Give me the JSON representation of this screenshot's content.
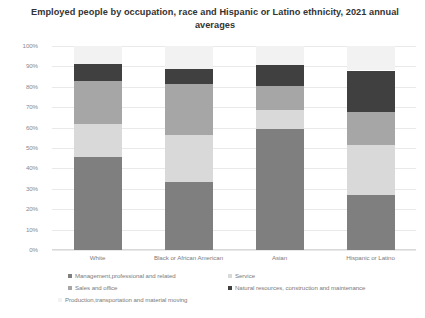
{
  "chart_data": {
    "type": "bar",
    "subtype": "stacked-percent",
    "title": "Employed people by occupation, race and Hispanic or Latino ethnicity, 2021 annual averages",
    "xlabel": "",
    "ylabel": "",
    "ylim": [
      0,
      100
    ],
    "grid": true,
    "legend_position": "bottom",
    "categories": [
      "White",
      "Black or African American",
      "Asian",
      "Hispanic or Latino"
    ],
    "ytick_labels": [
      "100%",
      "90%",
      "80%",
      "70%",
      "60%",
      "50%",
      "40%",
      "30%",
      "20%",
      "10%",
      "0%"
    ],
    "ytick_values": [
      100,
      90,
      80,
      70,
      60,
      50,
      40,
      30,
      20,
      10,
      0
    ],
    "series": [
      {
        "name": "Management,professional and related",
        "color": "#7f7f7f",
        "values": [
          45.5,
          33.5,
          59.5,
          27.0
        ]
      },
      {
        "name": "Service",
        "color": "#d9d9d9",
        "values": [
          16.5,
          23.0,
          9.0,
          24.5
        ]
      },
      {
        "name": "Sales and office",
        "color": "#a6a6a6",
        "values": [
          21.0,
          25.0,
          12.0,
          16.0
        ]
      },
      {
        "name": "Natural resources, construction and maintenance",
        "color": "#404040",
        "values": [
          8.0,
          7.0,
          10.0,
          20.5
        ]
      },
      {
        "name": "Production,transportation and material moving",
        "color": "#f2f2f2",
        "values": [
          9.0,
          11.5,
          9.5,
          12.0
        ]
      }
    ]
  },
  "legend": {
    "items": [
      "Management,professional and related",
      "Service",
      "Sales and office",
      "Natural resources, construction and maintenance",
      "Production,transportation and material moving"
    ]
  }
}
